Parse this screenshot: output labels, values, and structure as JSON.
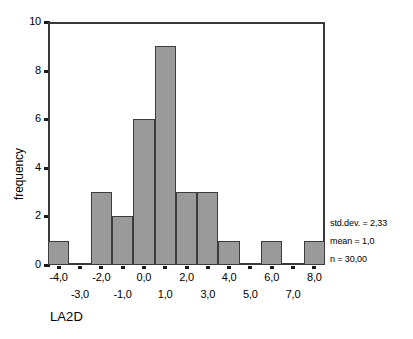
{
  "chart_data": {
    "type": "bar",
    "title": "",
    "subtitle": "",
    "xlabel": "LA2D",
    "ylabel": "frequency",
    "grid": false,
    "legend": "none",
    "xlim": [
      -4.5,
      8.5
    ],
    "ylim": [
      0,
      10
    ],
    "bin_width": 1.0,
    "categories": [
      "-4,0",
      "-3,0",
      "-2,0",
      "-1,0",
      "0,0",
      "1,0",
      "2,0",
      "3,0",
      "4,0",
      "5,0",
      "6,0",
      "7,0",
      "8,0"
    ],
    "x": [
      -4,
      -3,
      -2,
      -1,
      0,
      1,
      2,
      3,
      4,
      5,
      6,
      7,
      8
    ],
    "values": [
      1,
      0,
      3,
      2,
      6,
      9,
      3,
      3,
      1,
      0,
      1,
      0,
      1
    ],
    "yticks": [
      "0",
      "2",
      "4",
      "6",
      "8",
      "10"
    ],
    "ytick_values": [
      0,
      2,
      4,
      6,
      8,
      10
    ],
    "xticks_top": [
      "-4,0",
      "-2,0",
      "0,0",
      "2,0",
      "4,0",
      "6,0",
      "8,0"
    ],
    "xticks_top_values": [
      -4,
      -2,
      0,
      2,
      4,
      6,
      8
    ],
    "xticks_bottom": [
      "-3,0",
      "-1,0",
      "1,0",
      "3,0",
      "5,0",
      "7,0"
    ],
    "xticks_bottom_values": [
      -3,
      -1,
      1,
      3,
      5,
      7
    ],
    "annotations": [
      "std.dev. = 2,33",
      "mean = 1,0",
      "n = 30,00"
    ],
    "bar_fill_color": "#9a9a9a",
    "bar_border_color": "#3c3c3c",
    "axis_color": "#3a3a3a",
    "background_color": "#ffffff"
  },
  "axes": {
    "y_title": "frequency",
    "x_title": "LA2D"
  },
  "stats": {
    "std_dev": "std.dev. = 2,33",
    "mean": "mean = 1,0",
    "n": "n = 30,00"
  }
}
